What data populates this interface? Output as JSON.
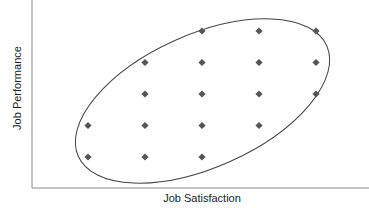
{
  "chart_data": {
    "type": "scatter",
    "title": "",
    "xlabel": "Job Satisfaction",
    "ylabel": "Job Performance",
    "xlim": [
      0.5,
      5.9
    ],
    "ylim": [
      0.3,
      5.5
    ],
    "grid": false,
    "legend": null,
    "x_ticks": [],
    "y_ticks": [],
    "points": [
      {
        "x": 3,
        "y": 5
      },
      {
        "x": 4,
        "y": 5
      },
      {
        "x": 5,
        "y": 5
      },
      {
        "x": 2,
        "y": 4
      },
      {
        "x": 3,
        "y": 4
      },
      {
        "x": 4,
        "y": 4
      },
      {
        "x": 5,
        "y": 4
      },
      {
        "x": 2,
        "y": 3
      },
      {
        "x": 3,
        "y": 3
      },
      {
        "x": 4,
        "y": 3
      },
      {
        "x": 5,
        "y": 3
      },
      {
        "x": 1,
        "y": 2
      },
      {
        "x": 2,
        "y": 2
      },
      {
        "x": 3,
        "y": 2
      },
      {
        "x": 4,
        "y": 2
      },
      {
        "x": 1,
        "y": 1
      },
      {
        "x": 2,
        "y": 1
      },
      {
        "x": 3,
        "y": 1
      }
    ],
    "annotations": [
      {
        "type": "ellipse",
        "description": "tilted ellipse enclosing the point cloud, indicating positive correlation",
        "center": [
          3.0,
          3.0
        ],
        "angle_deg": 24
      }
    ],
    "marker": {
      "shape": "diamond",
      "color": "#555555"
    },
    "ellipse_color": "#444444",
    "axis_color": "#888888"
  }
}
